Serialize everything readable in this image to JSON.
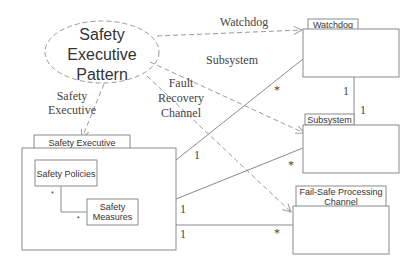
{
  "pattern": {
    "label_lines": [
      "Safety",
      "Executive",
      "Pattern"
    ]
  },
  "dependencies": [
    {
      "label_lines": [
        "Watchdog"
      ],
      "target": "Watchdog"
    },
    {
      "label_lines": [
        "Subsystem"
      ],
      "target": "Subsystem"
    },
    {
      "label_lines": [
        "Safety",
        "Executive"
      ],
      "target": "Safety Executive"
    },
    {
      "label_lines": [
        "Fault",
        "Recovery",
        "Channel"
      ],
      "target": "Fail-Safe Processing Channel"
    }
  ],
  "classes": {
    "safety_executive": {
      "tab": "Safety Executive"
    },
    "safety_policies": {
      "label": "Safety Policies"
    },
    "safety_measures": {
      "label_lines": [
        "Safety",
        "Measures"
      ]
    },
    "watchdog": {
      "tab": "Watchdog"
    },
    "subsystem": {
      "tab": "Subsystem"
    },
    "failsafe": {
      "tab_lines": [
        "Fail-Safe Processing",
        "Channel"
      ]
    }
  },
  "multiplicities": {
    "exec_watchdog_exec": "1",
    "exec_watchdog_wd": "*",
    "exec_subsystem_exec": "1",
    "exec_subsystem_sub": "*",
    "exec_failsafe_exec": "1",
    "exec_failsafe_fs": "*",
    "watchdog_subsystem_wd": "1",
    "watchdog_subsystem_sub": "1",
    "policies_measures_p": "*",
    "policies_measures_m": "*"
  }
}
